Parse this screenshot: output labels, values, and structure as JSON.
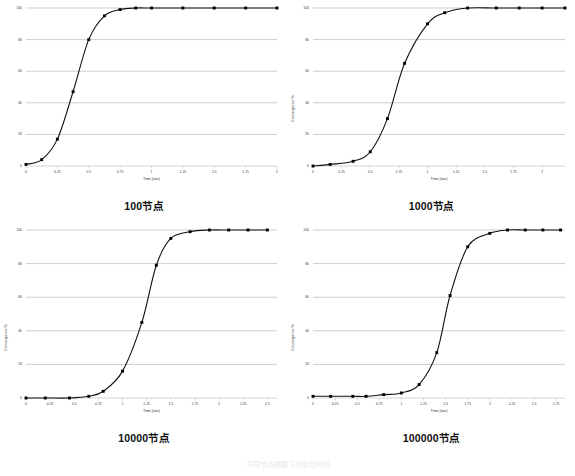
{
  "figure": {
    "footer_text": "不同节点规模下的收敛时间",
    "panels": [
      {
        "caption": "100节点",
        "show_ylabel": false,
        "chart": {
          "type": "line",
          "title": "100节点",
          "xlabel": "Time (sec)",
          "ylabel": "Convergence %",
          "xlim": [
            0,
            2
          ],
          "ylim": [
            0,
            100
          ],
          "xticks": [
            "0",
            "0.25",
            "0.5",
            "0.75",
            "1",
            "1.25",
            "1.5",
            "1.75",
            "2"
          ],
          "xtick_values": [
            0,
            0.25,
            0.5,
            0.75,
            1,
            1.25,
            1.5,
            1.75,
            2
          ],
          "yticks": [
            "0",
            "20",
            "40",
            "60",
            "80",
            "100"
          ],
          "ytick_values": [
            0,
            20,
            40,
            60,
            80,
            100
          ],
          "grid": "horizontal",
          "marker": "square",
          "x": [
            0,
            0.125,
            0.25,
            0.375,
            0.5,
            0.625,
            0.75,
            0.875,
            1.0,
            1.25,
            1.5,
            1.75,
            2.0
          ],
          "y": [
            1,
            4,
            17,
            47,
            80,
            95,
            99,
            100,
            100,
            100,
            100,
            100,
            100
          ]
        }
      },
      {
        "caption": "1000节点",
        "show_ylabel": true,
        "chart": {
          "type": "line",
          "title": "1000节点",
          "xlabel": "Time (sec)",
          "ylabel": "Convergence %",
          "xlim": [
            0,
            2.2
          ],
          "ylim": [
            0,
            100
          ],
          "xticks": [
            "0",
            "0.25",
            "0.5",
            "0.75",
            "1",
            "1.25",
            "1.5",
            "1.75",
            "2"
          ],
          "xtick_values": [
            0,
            0.25,
            0.5,
            0.75,
            1,
            1.25,
            1.5,
            1.75,
            2
          ],
          "yticks": [
            "0",
            "20",
            "40",
            "60",
            "80",
            "100"
          ],
          "ytick_values": [
            0,
            20,
            40,
            60,
            80,
            100
          ],
          "grid": "horizontal",
          "marker": "square",
          "x": [
            0,
            0.15,
            0.35,
            0.5,
            0.65,
            0.8,
            1.0,
            1.15,
            1.35,
            1.6,
            1.8,
            2.0,
            2.2
          ],
          "y": [
            0,
            1,
            3,
            9,
            30,
            65,
            90,
            97,
            100,
            100,
            100,
            100,
            100
          ]
        }
      },
      {
        "caption": "10000节点",
        "show_ylabel": true,
        "chart": {
          "type": "line",
          "title": "10000节点",
          "xlabel": "Time (sec)",
          "ylabel": "Convergence %",
          "xlim": [
            0,
            2.6
          ],
          "ylim": [
            0,
            100
          ],
          "xticks": [
            "0",
            "0.25",
            "0.5",
            "0.75",
            "1",
            "1.25",
            "1.5",
            "1.75",
            "2",
            "2.25",
            "2.5"
          ],
          "xtick_values": [
            0,
            0.25,
            0.5,
            0.75,
            1,
            1.25,
            1.5,
            1.75,
            2,
            2.25,
            2.5
          ],
          "yticks": [
            "0",
            "20",
            "40",
            "60",
            "80",
            "100"
          ],
          "ytick_values": [
            0,
            20,
            40,
            60,
            80,
            100
          ],
          "grid": "horizontal",
          "marker": "square",
          "x": [
            0,
            0.2,
            0.45,
            0.65,
            0.8,
            1.0,
            1.2,
            1.35,
            1.5,
            1.7,
            1.9,
            2.1,
            2.3,
            2.5
          ],
          "y": [
            0,
            0,
            0,
            1,
            4,
            16,
            45,
            79,
            95,
            99,
            100,
            100,
            100,
            100
          ]
        }
      },
      {
        "caption": "100000节点",
        "show_ylabel": true,
        "chart": {
          "type": "line",
          "title": "100000节点",
          "xlabel": "Time (sec)",
          "ylabel": "Convergence %",
          "xlim": [
            0,
            2.85
          ],
          "ylim": [
            0,
            100
          ],
          "xticks": [
            "0",
            "0.25",
            "0.5",
            "0.75",
            "1",
            "1.25",
            "1.5",
            "1.75",
            "2",
            "2.25",
            "2.5",
            "2.75"
          ],
          "xtick_values": [
            0,
            0.25,
            0.5,
            0.75,
            1,
            1.25,
            1.5,
            1.75,
            2,
            2.25,
            2.5,
            2.75
          ],
          "yticks": [
            "0",
            "20",
            "40",
            "60",
            "80",
            "100"
          ],
          "ytick_values": [
            0,
            20,
            40,
            60,
            80,
            100
          ],
          "grid": "horizontal",
          "marker": "square",
          "x": [
            0,
            0.2,
            0.45,
            0.6,
            0.8,
            1.0,
            1.2,
            1.4,
            1.55,
            1.75,
            2.0,
            2.2,
            2.4,
            2.6,
            2.8
          ],
          "y": [
            1,
            1,
            1,
            1,
            2,
            3,
            8,
            27,
            61,
            90,
            98,
            100,
            100,
            100,
            100
          ]
        }
      }
    ],
    "colors": {
      "line": "#111111",
      "marker": "#000000",
      "grid": "#b9b9b9",
      "axis": "#c9c9c9",
      "text": "#2a2a2a"
    }
  }
}
